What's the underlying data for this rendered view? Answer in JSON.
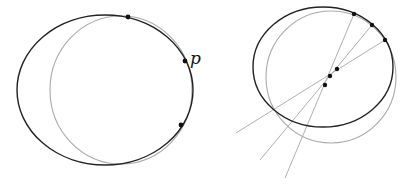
{
  "figure": {
    "width": 406,
    "height": 189,
    "colors": {
      "dark_curve": "#222222",
      "light_curve": "#aaaaaa",
      "line": "#b0b0b0",
      "point": "#111111",
      "background": "#ffffff"
    }
  },
  "left_panel": {
    "outer_ellipse": {
      "cx": 105,
      "cy": 90,
      "rx": 88,
      "ry": 75
    },
    "inner_circle": {
      "cx": 121,
      "cy": 90,
      "rx": 71,
      "ry": 74
    },
    "points": [
      {
        "x": 128,
        "y": 17
      },
      {
        "x": 185,
        "y": 61
      },
      {
        "x": 181,
        "y": 125
      }
    ],
    "point_label": {
      "text": "p",
      "x": 190,
      "y": 64
    }
  },
  "right_panel": {
    "outer_ellipse": {
      "cx": 323,
      "cy": 67,
      "rx": 70,
      "ry": 60
    },
    "inner_circle": {
      "cx": 331,
      "cy": 77,
      "rx": 65,
      "ry": 66
    },
    "boundary_points": [
      {
        "x": 354,
        "y": 14
      },
      {
        "x": 372,
        "y": 25
      },
      {
        "x": 385,
        "y": 40
      }
    ],
    "inner_points": [
      {
        "x": 337,
        "y": 69
      },
      {
        "x": 330,
        "y": 76
      },
      {
        "x": 325,
        "y": 85
      }
    ],
    "lines": [
      {
        "x1": 236,
        "y1": 133,
        "x2": 385,
        "y2": 40
      },
      {
        "x1": 260,
        "y1": 160,
        "x2": 372,
        "y2": 25
      },
      {
        "x1": 285,
        "y1": 178,
        "x2": 354,
        "y2": 14
      }
    ]
  }
}
